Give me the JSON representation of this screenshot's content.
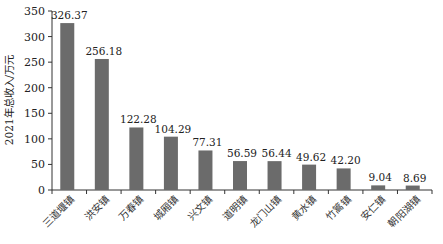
{
  "chart_data": {
    "type": "bar",
    "title": "",
    "xlabel": "",
    "ylabel": "2021年总收入/万元",
    "ylim": [
      0,
      350
    ],
    "yticks": [
      0,
      50,
      100,
      150,
      200,
      250,
      300,
      350
    ],
    "grid": false,
    "legend": null,
    "bar_color": "#6b6b6b",
    "categories": [
      "三道堰镇",
      "洪安镇",
      "万春镇",
      "城厢镇",
      "兴文镇",
      "道明镇",
      "龙门山镇",
      "黄水镇",
      "竹篙镇",
      "安仁镇",
      "朝阳湖镇"
    ],
    "values": [
      326.37,
      256.18,
      122.28,
      104.29,
      77.31,
      56.59,
      56.44,
      49.62,
      42.2,
      9.04,
      8.69
    ],
    "value_labels": [
      "326.37",
      "256.18",
      "122.28",
      "104.29",
      "77.31",
      "56.59",
      "56.44",
      "49.62",
      "42.20",
      "9.04",
      "8.69"
    ]
  }
}
